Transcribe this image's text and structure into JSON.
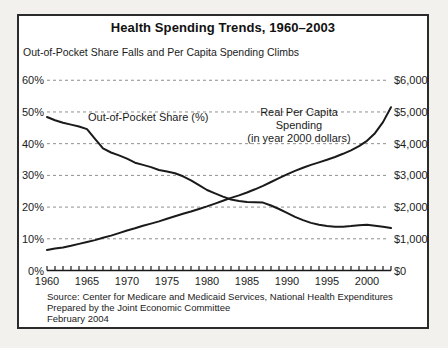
{
  "chart": {
    "title": "Health Spending Trends, 1960–2003",
    "subtitle": "Out-of-Pocket Share Falls and Per Capita Spending Climbs",
    "labels": {
      "oop_annotation": "Out-of-Pocket Share (%)",
      "spend_annotation_line1": "Real Per Capita Spending",
      "spend_annotation_line2": "(in year 2000 dollars)"
    },
    "source": {
      "line1": "Source: Center for Medicare and Medicaid Services, National Health Expenditures",
      "line2": "Prepared by the Joint Economic Committee",
      "line3": "February 2004"
    },
    "colors": {
      "line": "#1a1a1a",
      "grid": "#8f8f8f",
      "axis": "#1a1a1a",
      "frame": "#2b2b2b",
      "background": "#ffffff"
    }
  },
  "chart_data": {
    "type": "line",
    "title": "Health Spending Trends, 1960–2003",
    "subtitle": "Out-of-Pocket Share Falls and Per Capita Spending Climbs",
    "grid": "horizontal-dashed",
    "x": [
      1960,
      1961,
      1962,
      1963,
      1964,
      1965,
      1966,
      1967,
      1968,
      1969,
      1970,
      1971,
      1972,
      1973,
      1974,
      1975,
      1976,
      1977,
      1978,
      1979,
      1980,
      1981,
      1982,
      1983,
      1984,
      1985,
      1986,
      1987,
      1988,
      1989,
      1990,
      1991,
      1992,
      1993,
      1994,
      1995,
      1996,
      1997,
      1998,
      1999,
      2000,
      2001,
      2002,
      2003
    ],
    "series": [
      {
        "name": "Out-of-Pocket Share (%)",
        "axis": "left",
        "unit": "percent",
        "values": [
          48.4,
          47.4,
          46.6,
          46.0,
          45.4,
          44.6,
          41.5,
          38.5,
          37.2,
          36.3,
          35.3,
          34.0,
          33.3,
          32.6,
          31.7,
          31.2,
          30.7,
          29.7,
          28.4,
          26.9,
          25.4,
          24.3,
          23.3,
          22.4,
          21.9,
          21.6,
          21.5,
          21.4,
          20.5,
          19.4,
          18.2,
          16.9,
          15.9,
          15.0,
          14.4,
          14.0,
          13.8,
          13.8,
          14.0,
          14.3,
          14.4,
          14.1,
          13.8,
          13.4
        ]
      },
      {
        "name": "Real Per Capita Spending (in year 2000 dollars)",
        "axis": "right",
        "unit": "dollars",
        "values": [
          650,
          690,
          730,
          780,
          840,
          900,
          960,
          1030,
          1100,
          1180,
          1260,
          1330,
          1410,
          1480,
          1550,
          1630,
          1710,
          1790,
          1860,
          1940,
          2020,
          2110,
          2200,
          2290,
          2370,
          2460,
          2560,
          2670,
          2790,
          2910,
          3030,
          3140,
          3240,
          3330,
          3410,
          3490,
          3580,
          3680,
          3790,
          3920,
          4090,
          4330,
          4680,
          5150
        ]
      }
    ],
    "left_axis": {
      "range": [
        0,
        60
      ],
      "tick_step": 10,
      "tick_labels_top_to_bottom": [
        "60%",
        "50%",
        "40%",
        "30%",
        "20%",
        "10%",
        "0%"
      ]
    },
    "right_axis": {
      "range": [
        0,
        6000
      ],
      "tick_step": 1000,
      "tick_labels_top_to_bottom": [
        "$6,000",
        "$5,000",
        "$4,000",
        "$3,000",
        "$2,000",
        "$1,000",
        "$0"
      ]
    },
    "x_axis": {
      "range": [
        1960,
        2003
      ],
      "minor_tick_every_years": 1,
      "tick_labels": [
        1960,
        1965,
        1970,
        1975,
        1980,
        1985,
        1990,
        1995,
        2000
      ]
    },
    "legend_position": "inline-annotations"
  }
}
